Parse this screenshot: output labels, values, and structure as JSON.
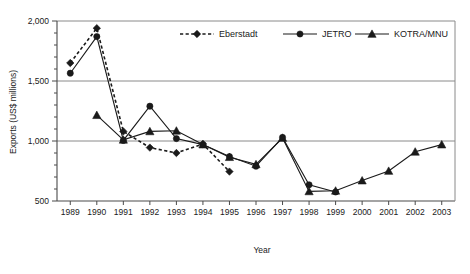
{
  "chart_data": {
    "type": "line",
    "title": "",
    "xlabel": "Year",
    "ylabel": "Exports (US$ millions)",
    "x": [
      1989,
      1990,
      1991,
      1992,
      1993,
      1994,
      1995,
      1996,
      1997,
      1998,
      1999,
      2000,
      2001,
      2002,
      2003
    ],
    "categories": [
      "1989",
      "1990",
      "1991",
      "1992",
      "1993",
      "1994",
      "1995",
      "1996",
      "1997",
      "1998",
      "1999",
      "2000",
      "2001",
      "2002",
      "2003"
    ],
    "xlim": [
      1988.5,
      2003.5
    ],
    "ylim": [
      500,
      2000
    ],
    "yticks": [
      500,
      1000,
      1500,
      2000
    ],
    "ytick_labels": [
      "500",
      "1,000",
      "1,500",
      "2,000"
    ],
    "yminor_step": 100,
    "grid": "horizontal-major",
    "legend_position": "top-center",
    "series": [
      {
        "name": "Eberstadt",
        "marker": "diamond",
        "line_style": "dashed",
        "color": "#1a1a1a",
        "values": [
          1650,
          1940,
          1080,
          945,
          900,
          975,
          745,
          null,
          null,
          null,
          null,
          null,
          null,
          null,
          null
        ]
      },
      {
        "name": "JETRO",
        "marker": "circle",
        "line_style": "solid",
        "color": "#1a1a1a",
        "values": [
          1565,
          1870,
          1005,
          1290,
          1020,
          970,
          870,
          790,
          1030,
          635,
          575,
          null,
          null,
          null,
          null
        ]
      },
      {
        "name": "KOTRA/MNU",
        "marker": "triangle",
        "line_style": "solid",
        "color": "#1a1a1a",
        "values": [
          null,
          1215,
          1010,
          1080,
          1085,
          970,
          865,
          805,
          1025,
          580,
          585,
          670,
          750,
          910,
          970
        ]
      }
    ]
  },
  "legend": {
    "items": [
      {
        "label": "Eberstadt"
      },
      {
        "label": "JETRO"
      },
      {
        "label": "KOTRA/MNU"
      }
    ]
  },
  "axes": {
    "y_title": "Exports (US$ millions)",
    "x_title": "Year"
  }
}
